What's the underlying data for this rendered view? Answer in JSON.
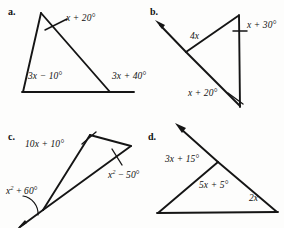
{
  "page": {
    "background": "#fdfdfc",
    "ink": "#151515",
    "width": 284,
    "height": 228
  },
  "figures": [
    {
      "id": "a",
      "part_label": "a.",
      "part_x": 8,
      "part_y": 6,
      "description": "triangle with apex at top-left, horizontal base extended to the right past the right vertex",
      "shapes": [
        {
          "name": "triangle-left-side",
          "type": "line",
          "points": "41,13 23,92"
        },
        {
          "name": "triangle-hypotenuse",
          "type": "line",
          "points": "41,13 110,92"
        },
        {
          "name": "base-with-extension",
          "type": "line",
          "points": "22,92 134,92"
        },
        {
          "name": "apex-angle-arc",
          "type": "line",
          "points": "45,30 66,20"
        }
      ],
      "labels": [
        {
          "name": "angle-label-apex",
          "text": "x + 20°",
          "x": 66,
          "y": 13,
          "italic": true
        },
        {
          "name": "angle-label-bottom-left",
          "text": "3x − 10°",
          "x": 28,
          "y": 71,
          "italic": true
        },
        {
          "name": "angle-label-exterior-right",
          "text": "3x + 40°",
          "x": 112,
          "y": 71,
          "italic": true
        }
      ]
    },
    {
      "id": "b",
      "part_label": "b.",
      "part_x": 150,
      "part_y": 6,
      "description": "triangle with vertical right side, left vertex with ray extending up and to the left",
      "shapes": [
        {
          "name": "upper-left-side",
          "type": "line",
          "points": "238,16 186,52"
        },
        {
          "name": "ray-upper-left",
          "type": "line",
          "points": "186,52 157,22"
        },
        {
          "name": "lower-long-side",
          "type": "line",
          "points": "186,52 240,106"
        },
        {
          "name": "vertical-right-side",
          "type": "line",
          "points": "239,15 240,107"
        },
        {
          "name": "tick-top-right",
          "type": "line",
          "points": "232,31 247,31"
        },
        {
          "name": "leader-bottom-right",
          "type": "line",
          "points": "229,94 243,104"
        }
      ],
      "arrowheads": [
        {
          "name": "arrowhead-upper-left-ray",
          "tip": "156,21",
          "angle": 226
        }
      ],
      "labels": [
        {
          "name": "angle-label-top-right",
          "text": "x + 30°",
          "x": 247,
          "y": 20,
          "italic": true
        },
        {
          "name": "side-label-4x",
          "text": "4x",
          "x": 190,
          "y": 31,
          "italic": true
        },
        {
          "name": "angle-label-bottom-right",
          "text": "x + 20°",
          "x": 188,
          "y": 88,
          "italic": true
        }
      ]
    },
    {
      "id": "c",
      "part_label": "c.",
      "part_x": 8,
      "part_y": 131,
      "description": "narrow triangle pointing down-left, with ray extending beyond the bottom-left vertex",
      "shapes": [
        {
          "name": "left-long-side",
          "type": "line",
          "points": "90,135 43,210"
        },
        {
          "name": "top-side",
          "type": "line",
          "points": "90,135 131,146"
        },
        {
          "name": "right-long-side",
          "type": "line",
          "points": "131,146 43,210"
        },
        {
          "name": "ray-lower-left",
          "type": "line",
          "points": "43,210 20,227"
        },
        {
          "name": "tick-apex",
          "type": "line",
          "points": "83,143 95,133"
        },
        {
          "name": "tick-right-vertex",
          "type": "line",
          "points": "113,150 122,164"
        },
        {
          "name": "arc-bottom-left",
          "type": "arc",
          "points": "24,198 A 16 16 0 0 1 37,216"
        }
      ],
      "labels": [
        {
          "name": "angle-label-apex",
          "text": "10x + 10°",
          "x": 25,
          "y": 139,
          "italic": true
        },
        {
          "name": "angle-label-right",
          "text": "x² − 50°",
          "x": 108,
          "y": 168,
          "italic": true,
          "superscript": true
        },
        {
          "name": "angle-label-bottom-left",
          "text": "x² + 60°",
          "x": 6,
          "y": 184,
          "italic": true,
          "superscript": true
        }
      ]
    },
    {
      "id": "d",
      "part_label": "d.",
      "part_x": 148,
      "part_y": 131,
      "description": "triangle with horizontal base and a ray from the upper vertex going up and to the left",
      "shapes": [
        {
          "name": "left-side",
          "type": "line",
          "points": "218,162 158,213"
        },
        {
          "name": "right-side",
          "type": "line",
          "points": "218,162 277,212"
        },
        {
          "name": "base",
          "type": "line",
          "points": "157,213 278,212"
        },
        {
          "name": "ray-upper-left",
          "type": "line",
          "points": "218,162 178,126"
        }
      ],
      "arrowheads": [
        {
          "name": "arrowhead-upper-left-ray",
          "tip": "176,124",
          "angle": 222
        }
      ],
      "labels": [
        {
          "name": "angle-label-exterior",
          "text": "3x + 15°",
          "x": 165,
          "y": 154,
          "italic": true
        },
        {
          "name": "angle-label-interior",
          "text": "5x + 5°",
          "x": 199,
          "y": 180,
          "italic": true
        },
        {
          "name": "angle-label-bottom-right",
          "text": "2x",
          "x": 249,
          "y": 193,
          "italic": true
        }
      ]
    }
  ]
}
